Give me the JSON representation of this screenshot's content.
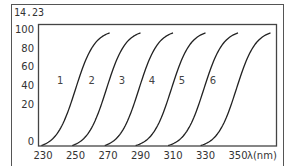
{
  "figure_label": "14.23",
  "chart_data": {
    "type": "line",
    "title": "",
    "xlabel": "λ(nm)",
    "ylabel": "",
    "xlim": [
      228,
      372
    ],
    "ylim": [
      0,
      100
    ],
    "x_ticks": [
      230,
      250,
      270,
      290,
      310,
      330,
      350
    ],
    "y_ticks": [
      0,
      20,
      40,
      60,
      80,
      100
    ],
    "grid": false,
    "legend": "none",
    "series": [
      {
        "name": "1",
        "midpoint_nm": 250,
        "start_nm": 229,
        "end_nm": 271,
        "max_value": 95
      },
      {
        "name": "2",
        "midpoint_nm": 269,
        "start_nm": 248,
        "end_nm": 290,
        "max_value": 95
      },
      {
        "name": "3",
        "midpoint_nm": 289,
        "start_nm": 268,
        "end_nm": 310,
        "max_value": 95
      },
      {
        "name": "4",
        "midpoint_nm": 309,
        "start_nm": 287,
        "end_nm": 330,
        "max_value": 95
      },
      {
        "name": "5",
        "midpoint_nm": 329,
        "start_nm": 307,
        "end_nm": 350,
        "max_value": 95
      },
      {
        "name": "6",
        "midpoint_nm": 349,
        "start_nm": 327,
        "end_nm": 370,
        "max_value": 95
      }
    ],
    "curve_labels": [
      {
        "text": "1",
        "x_nm": 240.5,
        "y": 55
      },
      {
        "text": "2",
        "x_nm": 260,
        "y": 55
      },
      {
        "text": "3",
        "x_nm": 278.5,
        "y": 55
      },
      {
        "text": "4",
        "x_nm": 297,
        "y": 55
      },
      {
        "text": "5",
        "x_nm": 315.5,
        "y": 55
      },
      {
        "text": "6",
        "x_nm": 334.5,
        "y": 55
      }
    ]
  }
}
